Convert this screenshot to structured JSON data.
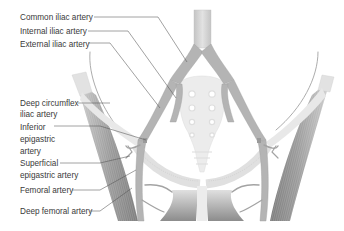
{
  "figure": {
    "colors": {
      "background": "#ffffff",
      "artery": "#b4b4b4",
      "muscle_dark": "#8a8a8a",
      "bone": "#ececec",
      "label_text": "#3a3a3a",
      "leader_line": "#555555"
    }
  },
  "labels": [
    {
      "id": "common-iliac",
      "text": "Common iliac artery",
      "lines": [
        "Common iliac artery"
      ]
    },
    {
      "id": "internal-iliac",
      "text": "Internal iliac artery",
      "lines": [
        "Internal iliac artery"
      ]
    },
    {
      "id": "external-iliac",
      "text": "External iliac artery",
      "lines": [
        "External iliac artery"
      ]
    },
    {
      "id": "deep-circumflex-iliac",
      "text": "Deep circumflex iliac artery",
      "lines": [
        "Deep circumflex",
        "iliac artery"
      ]
    },
    {
      "id": "inferior-epigastric",
      "text": "Inferior epigastric artery",
      "lines": [
        "Inferior",
        "epigastric",
        "artery"
      ]
    },
    {
      "id": "superficial-epigastric",
      "text": "Superficial epigastric artery",
      "lines": [
        "Superficial",
        "epigastric artery"
      ]
    },
    {
      "id": "femoral",
      "text": "Femoral artery",
      "lines": [
        "Femoral artery"
      ]
    },
    {
      "id": "deep-femoral",
      "text": "Deep femoral artery",
      "lines": [
        "Deep femoral artery"
      ]
    }
  ]
}
